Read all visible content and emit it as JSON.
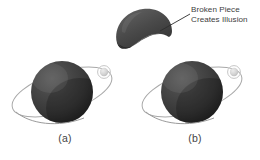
{
  "figure": {
    "type": "illustration",
    "background_color": "#ffffff",
    "annotation": {
      "line1": "Broken Piece",
      "line2": "Creates Illusion",
      "text_color": "#3d3d3d",
      "leader_line_color": "#2e2e2e"
    },
    "panels": [
      {
        "id": "a",
        "label": "(a)",
        "center_x": 62,
        "center_y": 92,
        "sphere_radius": 31,
        "sphere_color": "#3b3b3b",
        "sphere_highlight_color": "#565656",
        "sphere_shadow_color": "#1e1e1e",
        "has_broken_piece": false,
        "moon": {
          "cx": 104,
          "cy": 72,
          "r": 4.2,
          "color": "#d8d8d8",
          "ring_color": "#b4b4b4"
        },
        "orbit": {
          "rx": 52,
          "ry": 20,
          "rotation_deg": -18,
          "stroke_color": "#a9a9a9",
          "stroke_width": 1
        }
      },
      {
        "id": "b",
        "label": "(b)",
        "center_x": 192,
        "center_y": 92,
        "sphere_radius": 31,
        "sphere_color": "#3b3b3b",
        "sphere_highlight_color": "#565656",
        "sphere_shadow_color": "#1e1e1e",
        "has_broken_piece": true,
        "moon": {
          "cx": 234,
          "cy": 72,
          "r": 4.2,
          "color": "#d8d8d8",
          "ring_color": "#b4b4b4"
        },
        "orbit": {
          "rx": 52,
          "ry": 20,
          "rotation_deg": -18,
          "stroke_color": "#a9a9a9",
          "stroke_width": 1
        }
      }
    ],
    "broken_piece": {
      "name": "broken-dome-fragment",
      "center_x": 144,
      "center_y": 28,
      "width": 56,
      "height": 40,
      "fill_color": "#4a4a4a",
      "highlight_color": "#5e5e5e",
      "shadow_color": "#2b2b2b"
    }
  }
}
